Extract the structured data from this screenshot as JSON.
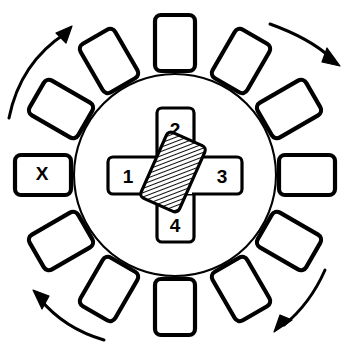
{
  "figure": {
    "background_color": "#ffffff",
    "line_color": "#000000",
    "canvas": {
      "width": 350,
      "height": 351
    }
  },
  "ring": {
    "name": "index-circle",
    "center": {
      "x": 175,
      "y": 175
    },
    "radius": 101,
    "stroke_width": 2.1
  },
  "center_cross": {
    "horizontal_bar": {
      "x": 108,
      "y": 157,
      "width": 134,
      "height": 37,
      "corner_radius": 5
    },
    "vertical_bar": {
      "x": 157,
      "y": 108,
      "width": 37,
      "height": 134,
      "corner_radius": 5
    },
    "cells": [
      {
        "id": "cell-1",
        "label": "1",
        "position": "left",
        "cx": 128,
        "cy": 177
      },
      {
        "id": "cell-2",
        "label": "2",
        "position": "top",
        "cx": 175,
        "cy": 130
      },
      {
        "id": "cell-3",
        "label": "3",
        "position": "right",
        "cx": 222,
        "cy": 177
      },
      {
        "id": "cell-4",
        "label": "4",
        "position": "bottom",
        "cx": 175,
        "cy": 226
      }
    ]
  },
  "workpiece": {
    "name": "hatched-workpiece",
    "cx": 173,
    "cy": 172,
    "width": 42,
    "height": 72,
    "rotation_deg": 24,
    "fill_pattern": "diagonal-hatch",
    "hatch_angle_deg": 45,
    "hatch_spacing_px": 4
  },
  "stations": [
    {
      "id": "station-00",
      "label": "",
      "angle_deg": 0,
      "cx": 175,
      "cy": 43,
      "width": 40,
      "height": 56,
      "rotation_deg": 0
    },
    {
      "id": "station-01",
      "label": "",
      "angle_deg": 30,
      "cx": 241,
      "cy": 61,
      "width": 40,
      "height": 56,
      "rotation_deg": 30
    },
    {
      "id": "station-02",
      "label": "",
      "angle_deg": 60,
      "cx": 289,
      "cy": 109,
      "width": 40,
      "height": 56,
      "rotation_deg": 60
    },
    {
      "id": "station-03",
      "label": "",
      "angle_deg": 90,
      "cx": 307,
      "cy": 175,
      "width": 40,
      "height": 56,
      "rotation_deg": 90
    },
    {
      "id": "station-04",
      "label": "",
      "angle_deg": 120,
      "cx": 289,
      "cy": 241,
      "width": 40,
      "height": 56,
      "rotation_deg": 120
    },
    {
      "id": "station-05",
      "label": "",
      "angle_deg": 150,
      "cx": 241,
      "cy": 289,
      "width": 40,
      "height": 56,
      "rotation_deg": 150
    },
    {
      "id": "station-06",
      "label": "",
      "angle_deg": 180,
      "cx": 175,
      "cy": 307,
      "width": 40,
      "height": 56,
      "rotation_deg": 180
    },
    {
      "id": "station-07",
      "label": "",
      "angle_deg": 210,
      "cx": 109,
      "cy": 289,
      "width": 40,
      "height": 56,
      "rotation_deg": 210
    },
    {
      "id": "station-08",
      "label": "",
      "angle_deg": 240,
      "cx": 61,
      "cy": 241,
      "width": 40,
      "height": 56,
      "rotation_deg": 240
    },
    {
      "id": "station-09",
      "label": "X",
      "angle_deg": 270,
      "cx": 43,
      "cy": 175,
      "width": 40,
      "height": 56,
      "rotation_deg": 270
    },
    {
      "id": "station-10",
      "label": "",
      "angle_deg": 300,
      "cx": 61,
      "cy": 109,
      "width": 40,
      "height": 56,
      "rotation_deg": 300
    },
    {
      "id": "station-11",
      "label": "",
      "angle_deg": 330,
      "cx": 109,
      "cy": 61,
      "width": 40,
      "height": 56,
      "rotation_deg": 330
    }
  ],
  "rotation_arrows": [
    {
      "id": "arrow-top-left",
      "direction": "clockwise",
      "quadrant": "top-left"
    },
    {
      "id": "arrow-top-right",
      "direction": "clockwise",
      "quadrant": "top-right"
    },
    {
      "id": "arrow-bottom-right",
      "direction": "clockwise",
      "quadrant": "bottom-right"
    },
    {
      "id": "arrow-bottom-left",
      "direction": "clockwise",
      "quadrant": "bottom-left"
    }
  ]
}
